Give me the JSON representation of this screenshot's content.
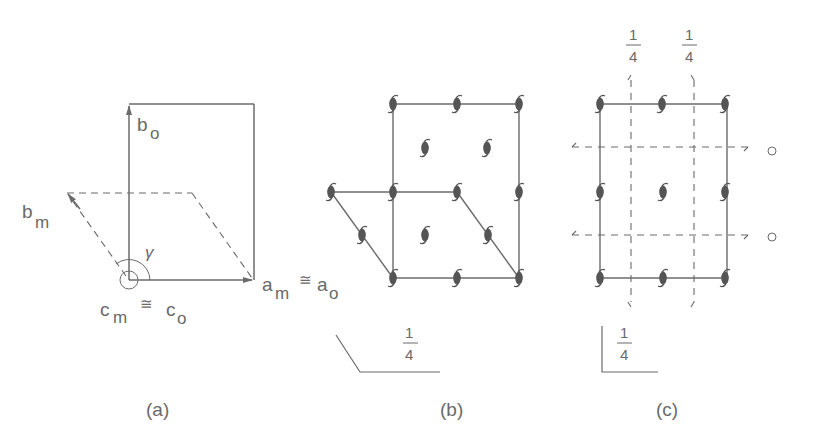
{
  "panels": {
    "a": {
      "caption": "(a)",
      "labels": {
        "b_o": "b",
        "b_o_sub": "o",
        "b_m": "b",
        "b_m_sub": "m",
        "gamma": "γ",
        "c_m": "c",
        "c_m_sub": "m",
        "c_congruent": "≅",
        "c_o": "c",
        "c_o_sub": "o",
        "a_m": "a",
        "a_m_sub": "m",
        "a_congruent": "≅",
        "a_o": "a",
        "a_o_sub": "o"
      }
    },
    "b": {
      "caption": "(b)",
      "fraction_num": "1",
      "fraction_den": "4"
    },
    "c": {
      "caption": "(c)",
      "fraction_num": "1",
      "fraction_den": "4",
      "top_fraction_1_num": "1",
      "top_fraction_1_den": "4",
      "top_fraction_2_num": "1",
      "top_fraction_2_den": "4"
    }
  },
  "colors": {
    "line": "#6b6b6b",
    "symbol": "#555555",
    "text": "#6a6a6a"
  }
}
